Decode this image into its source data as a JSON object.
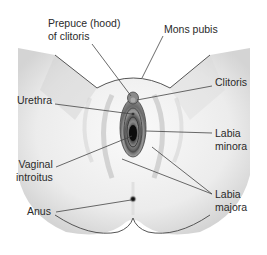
{
  "diagram": {
    "colors": {
      "outline": "#555555",
      "leader": "#444444",
      "text": "#2a2a2a",
      "tissue_dark": "#1a1a1a",
      "tissue_mid": "#7a7a7a",
      "tissue_light": "#b0b0b0"
    },
    "labels": {
      "prepuce_line1": "Prepuce (hood)",
      "prepuce_line2": "of clitoris",
      "mons_pubis": "Mons pubis",
      "clitoris": "Clitoris",
      "urethra": "Urethra",
      "labia_minora_line1": "Labia",
      "labia_minora_line2": "minora",
      "vaginal_line1": "Vaginal",
      "vaginal_line2": "introitus",
      "labia_majora_line1": "Labia",
      "labia_majora_line2": "majora",
      "anus": "Anus"
    }
  }
}
